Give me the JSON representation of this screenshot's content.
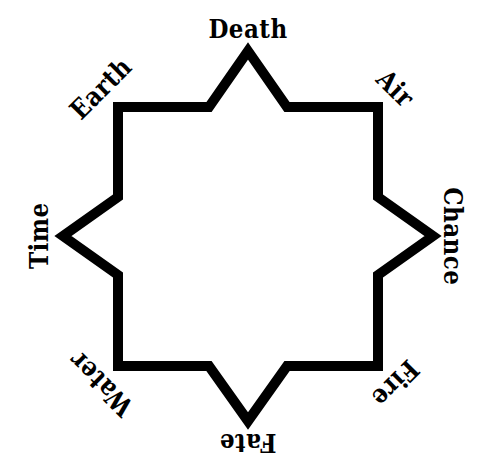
{
  "diagram": {
    "shape_name": "eight-pointed-star",
    "background_color": "#ffffff",
    "stroke_color": "#000000",
    "text_color": "#000000",
    "stroke_width": 10,
    "center": {
      "x": 248,
      "y": 236
    },
    "outer_radius": 185,
    "inner_radius": 131,
    "label_radius": 208,
    "point_count": 8
  },
  "nodes": [
    {
      "label": "Death",
      "angle_deg": 270,
      "rotation_deg": 0,
      "position": {
        "x": 248,
        "y": 30
      }
    },
    {
      "label": "Air",
      "angle_deg": 315,
      "rotation_deg": 45,
      "position": {
        "x": 395,
        "y": 89
      }
    },
    {
      "label": "Chance",
      "angle_deg": 0,
      "rotation_deg": 90,
      "position": {
        "x": 452,
        "y": 236
      }
    },
    {
      "label": "Fire",
      "angle_deg": 45,
      "rotation_deg": 135,
      "position": {
        "x": 395,
        "y": 383
      }
    },
    {
      "label": "Fate",
      "angle_deg": 90,
      "rotation_deg": 180,
      "position": {
        "x": 248,
        "y": 442
      }
    },
    {
      "label": "Water",
      "angle_deg": 135,
      "rotation_deg": 225,
      "position": {
        "x": 101,
        "y": 383
      }
    },
    {
      "label": "Time",
      "angle_deg": 180,
      "rotation_deg": 270,
      "position": {
        "x": 40,
        "y": 236
      }
    },
    {
      "label": "Earth",
      "angle_deg": 225,
      "rotation_deg": 315,
      "position": {
        "x": 101,
        "y": 89
      }
    }
  ],
  "star_points": [
    {
      "x": 248,
      "y": 51,
      "type": "outer",
      "name": "top"
    },
    {
      "x": 287,
      "y": 107,
      "type": "inner"
    },
    {
      "x": 378,
      "y": 107,
      "type": "outer",
      "name": "top-right"
    },
    {
      "x": 378,
      "y": 197,
      "type": "inner"
    },
    {
      "x": 433,
      "y": 236,
      "type": "outer",
      "name": "right"
    },
    {
      "x": 378,
      "y": 275,
      "type": "inner"
    },
    {
      "x": 378,
      "y": 366,
      "type": "outer",
      "name": "bottom-right"
    },
    {
      "x": 287,
      "y": 366,
      "type": "inner"
    },
    {
      "x": 248,
      "y": 421,
      "type": "outer",
      "name": "bottom"
    },
    {
      "x": 209,
      "y": 366,
      "type": "inner"
    },
    {
      "x": 118,
      "y": 366,
      "type": "outer",
      "name": "bottom-left"
    },
    {
      "x": 118,
      "y": 275,
      "type": "inner"
    },
    {
      "x": 63,
      "y": 236,
      "type": "outer",
      "name": "left"
    },
    {
      "x": 118,
      "y": 197,
      "type": "inner"
    },
    {
      "x": 118,
      "y": 107,
      "type": "outer",
      "name": "top-left"
    },
    {
      "x": 209,
      "y": 107,
      "type": "inner"
    }
  ]
}
